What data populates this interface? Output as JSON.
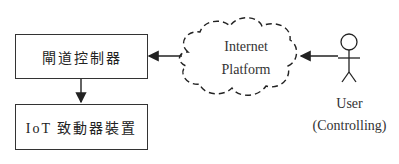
{
  "diagram": {
    "nodes": {
      "gateway": {
        "label": "閘道控制器"
      },
      "actuator": {
        "label": "IoT 致動器裝置"
      },
      "cloud": {
        "line1": "Internet",
        "line2": "Platform"
      },
      "user": {
        "line1": "User",
        "line2": "(Controlling)"
      }
    },
    "edges": [
      {
        "from": "user",
        "to": "cloud"
      },
      {
        "from": "cloud",
        "to": "gateway"
      },
      {
        "from": "gateway",
        "to": "actuator"
      }
    ]
  }
}
